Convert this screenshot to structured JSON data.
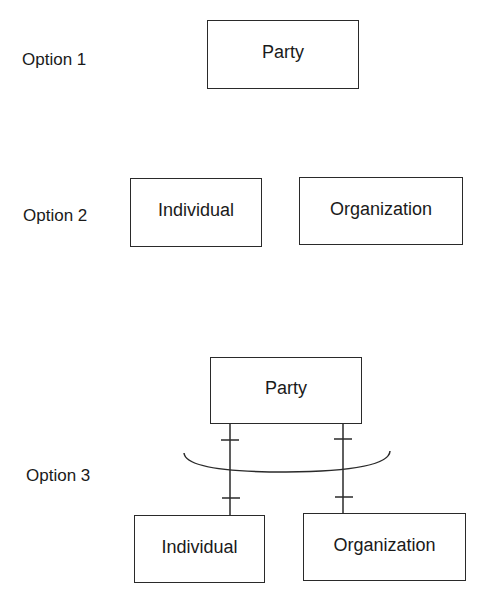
{
  "diagram": {
    "options": [
      {
        "label": "Option 1",
        "entities": [
          {
            "name": "Party"
          }
        ]
      },
      {
        "label": "Option 2",
        "entities": [
          {
            "name": "Individual"
          },
          {
            "name": "Organization"
          }
        ]
      },
      {
        "label": "Option 3",
        "supertype": {
          "name": "Party"
        },
        "subtypes": [
          {
            "name": "Individual"
          },
          {
            "name": "Organization"
          }
        ],
        "relationship": "exclusive-arc (one-to-one mandatory links from Party to each subtype)"
      }
    ],
    "colors": {
      "line": "#2a2a2a",
      "text": "#1a1a1a",
      "background": "#ffffff"
    }
  }
}
